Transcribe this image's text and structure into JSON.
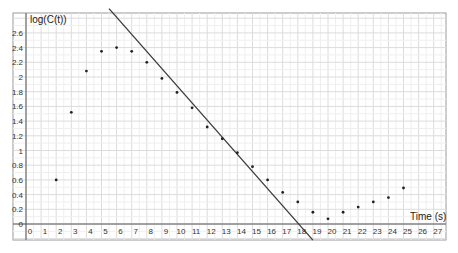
{
  "chart_data": {
    "type": "scatter",
    "title": "",
    "xlabel": "Time (s)",
    "ylabel": "log(C(t))",
    "xlim": [
      0,
      27
    ],
    "ylim": [
      0,
      2.6
    ],
    "grid": true,
    "legend": "none",
    "x_ticks": [
      "0",
      "1",
      "2",
      "3",
      "4",
      "5",
      "6",
      "7",
      "8",
      "9",
      "10",
      "11",
      "12",
      "13",
      "14",
      "15",
      "16",
      "17",
      "18",
      "19",
      "20",
      "21",
      "22",
      "23",
      "24",
      "25",
      "26",
      "27"
    ],
    "y_ticks": [
      "0",
      "0.2",
      "0.4",
      "0.6",
      "0.8",
      "1",
      "1.2",
      "1.4",
      "1.6",
      "1.8",
      "2",
      "2.2",
      "2.4",
      "2.6"
    ],
    "series": [
      {
        "name": "log(C(t))",
        "type": "scatter",
        "x": [
          2,
          3,
          4,
          5,
          6,
          7,
          8,
          9,
          10,
          11,
          12,
          13,
          14,
          15,
          16,
          17,
          18,
          19,
          20,
          21,
          22,
          23,
          24,
          25
        ],
        "y": [
          0.6,
          1.52,
          2.08,
          2.35,
          2.4,
          2.35,
          2.2,
          1.98,
          1.79,
          1.58,
          1.32,
          1.16,
          0.97,
          0.78,
          0.6,
          0.43,
          0.3,
          0.16,
          0.07,
          0.16,
          0.23,
          0.3,
          0.36,
          0.49
        ]
      },
      {
        "name": "regression line",
        "type": "line",
        "x": [
          5.5,
          19.0
        ],
        "y": [
          2.93,
          -0.22
        ]
      }
    ]
  }
}
